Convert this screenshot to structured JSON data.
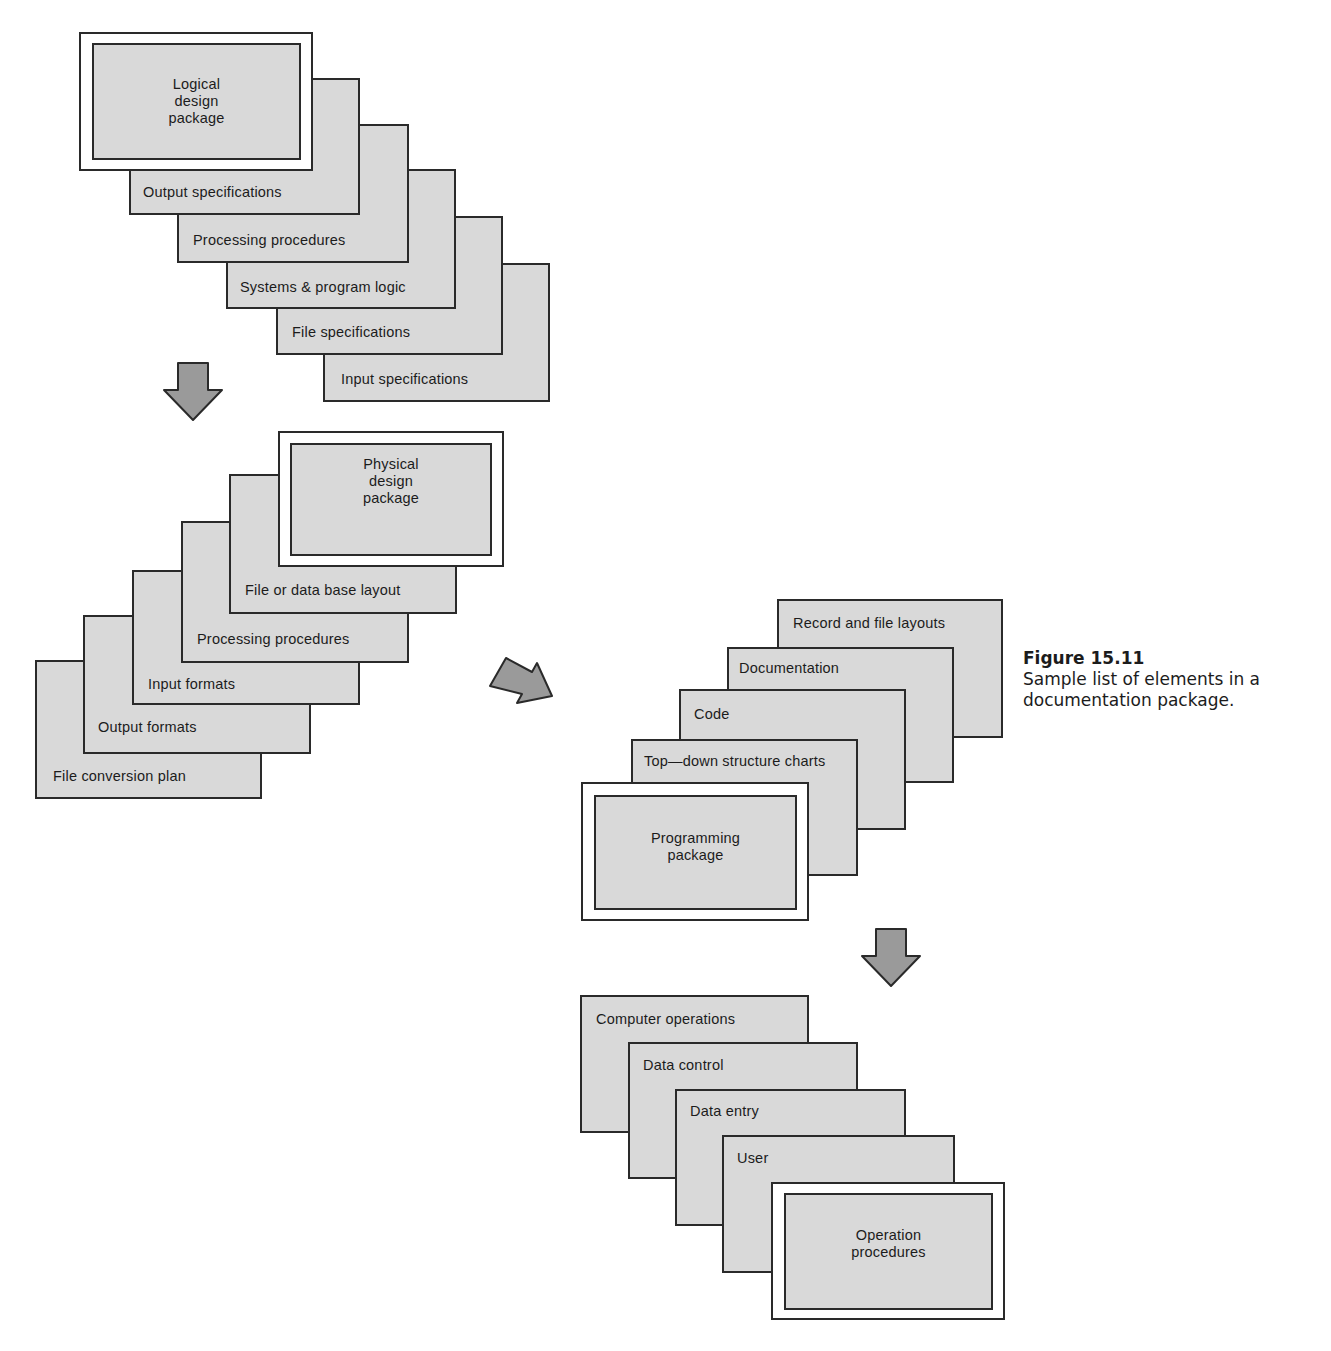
{
  "figure": {
    "number": "Figure 15.11",
    "caption": "Sample list of elements in a documentation package."
  },
  "colors": {
    "card_fill": "#d9d9d9",
    "stroke": "#2a2a2a",
    "arrow_fill": "#9a9a9a"
  },
  "stacks": {
    "logical": {
      "title": "Logical\ndesign\npackage",
      "items": [
        "Output specifications",
        "Processing procedures",
        "Systems & program logic",
        "File specifications",
        "Input specifications"
      ]
    },
    "physical": {
      "title": "Physical\ndesign\npackage",
      "items": [
        "File or data base layout",
        "Processing procedures",
        "Input formats",
        "Output formats",
        "File conversion plan"
      ]
    },
    "programming": {
      "title": "Programming\npackage",
      "items": [
        "Record and file layouts",
        "Documentation",
        "Code",
        "Top—down structure charts"
      ]
    },
    "operation": {
      "title": "Operation\nprocedures",
      "items": [
        "Computer operations",
        "Data control",
        "Data entry",
        "User"
      ]
    }
  },
  "arrows": [
    {
      "name": "arrow-logical-to-physical",
      "direction": "down"
    },
    {
      "name": "arrow-physical-to-programming",
      "direction": "down-right"
    },
    {
      "name": "arrow-programming-to-operation",
      "direction": "down"
    }
  ]
}
